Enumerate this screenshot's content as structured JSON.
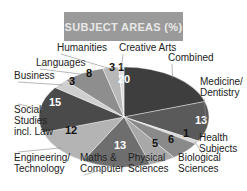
{
  "title": "SUBJECT AREAS (%)",
  "chart_data": {
    "type": "pie",
    "title": "SUBJECT AREAS (%)",
    "categories": [
      "Combined",
      "Medicine/Dentistry",
      "Health Subjects",
      "Biological Sciences",
      "Physical Sciences",
      "Maths & Computer",
      "Engineering/Technology",
      "Social Studies incl. Law",
      "Business",
      "Languages",
      "Humanities",
      "Creative Arts"
    ],
    "values": [
      20,
      13,
      1,
      6,
      5,
      13,
      12,
      15,
      3,
      8,
      3,
      1
    ],
    "unit": "%",
    "legend": "none (leader-line labels)"
  },
  "slices": [
    {
      "name": "Combined",
      "value": "20",
      "label": [
        "Combined"
      ],
      "color": "#3e3e3e",
      "text": "#ffffff",
      "lx": 168,
      "ly": 61,
      "vx": 124,
      "vy": 83
    },
    {
      "name": "Medicine/Dentistry",
      "value": "13",
      "label": [
        "Medicine/",
        "Dentistry"
      ],
      "color": "#5a5a5a",
      "text": "#ffffff",
      "lx": 200,
      "ly": 85,
      "vx": 201,
      "vy": 124
    },
    {
      "name": "Health Subjects",
      "value": "1",
      "label": [
        "Health",
        "Subjects"
      ],
      "color": "#d8d8d8",
      "text": "#111111",
      "lx": 199,
      "ly": 141,
      "vx": 186,
      "vy": 137
    },
    {
      "name": "Biological Sciences",
      "value": "6",
      "label": [
        "Biological",
        "Sciences"
      ],
      "color": "#8a8a8a",
      "text": "#111111",
      "lx": 178,
      "ly": 161,
      "vx": 171,
      "vy": 143
    },
    {
      "name": "Physical Sciences",
      "value": "5",
      "label": [
        "Physical",
        "Sciences"
      ],
      "color": "#a8a8a8",
      "text": "#111111",
      "lx": 128,
      "ly": 161,
      "vx": 155,
      "vy": 147
    },
    {
      "name": "Maths & Computer",
      "value": "13",
      "label": [
        "Maths &",
        "Computer"
      ],
      "color": "#6e6e6e",
      "text": "#ffffff",
      "lx": 80,
      "ly": 161,
      "vx": 120,
      "vy": 149
    },
    {
      "name": "Engineering/Technology",
      "value": "12",
      "label": [
        "Engineering/",
        "Technology"
      ],
      "color": "#b4b4b4",
      "text": "#111111",
      "lx": 14,
      "ly": 161,
      "vx": 71,
      "vy": 134
    },
    {
      "name": "Social Studies incl. Law",
      "value": "15",
      "label": [
        "Social",
        "Studies",
        "incl. Law"
      ],
      "color": "#4a4a4a",
      "text": "#ffffff",
      "lx": 14,
      "ly": 113,
      "vx": 55,
      "vy": 106
    },
    {
      "name": "Business",
      "value": "3",
      "label": [
        "Business"
      ],
      "color": "#cfcfcf",
      "text": "#111111",
      "lx": 14,
      "ly": 79,
      "vx": 72,
      "vy": 85
    },
    {
      "name": "Languages",
      "value": "8",
      "label": [
        "Languages"
      ],
      "color": "#8e8e8e",
      "text": "#111111",
      "lx": 36,
      "ly": 66,
      "vx": 89,
      "vy": 77
    },
    {
      "name": "Humanities",
      "value": "3",
      "label": [
        "Humanities"
      ],
      "color": "#b8b8b8",
      "text": "#111111",
      "lx": 57,
      "ly": 51,
      "vx": 112,
      "vy": 71
    },
    {
      "name": "Creative Arts",
      "value": "1",
      "label": [
        "Creative Arts"
      ],
      "color": "#e0e0e0",
      "text": "#111111",
      "lx": 119,
      "ly": 51,
      "vx": 121,
      "vy": 71
    }
  ]
}
